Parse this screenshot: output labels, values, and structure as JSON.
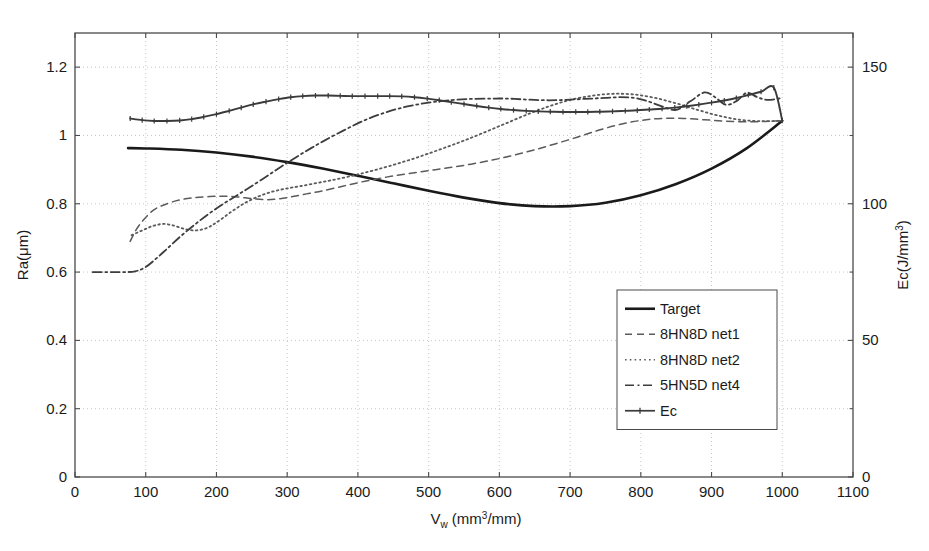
{
  "chart_data": {
    "type": "line",
    "title": "",
    "xlabel": "V_w (mm^3/mm)",
    "xlabel_parts": {
      "main": "V",
      "sub": "w",
      "unit_pre": " (mm",
      "unit_sup": "3",
      "unit_post": "/mm)"
    },
    "ylabel_left": "Ra(μm)",
    "ylabel_right": "Ec(J/mm^3)",
    "ylabel_right_parts": {
      "pre": "Ec(J/mm",
      "sup": "3",
      "post": ")"
    },
    "xlim": [
      0,
      1100
    ],
    "ylim_left": [
      0,
      1.3
    ],
    "ylim_right": [
      0,
      162.5
    ],
    "xticks": [
      0,
      100,
      200,
      300,
      400,
      500,
      600,
      700,
      800,
      900,
      1000,
      1100
    ],
    "xtick_labels": [
      "0",
      "100",
      "200",
      "300",
      "400",
      "500",
      "600",
      "700",
      "800",
      "900",
      "1000",
      "1100"
    ],
    "yticks_left": [
      0,
      0.2,
      0.4,
      0.6,
      0.8,
      1.0,
      1.2
    ],
    "ytick_labels_left": [
      "0",
      "0.2",
      "0.4",
      "0.6",
      "0.8",
      "1",
      "1.2"
    ],
    "yticks_right": [
      0,
      50,
      100,
      150
    ],
    "ytick_labels_right": [
      "0",
      "50",
      "100",
      "150"
    ],
    "grid": true,
    "grid_style": "dotted",
    "legend_position": "center-right",
    "series": [
      {
        "name": "Target",
        "style": "solid",
        "color": "#1a1a1a",
        "width": 2.6,
        "axis": "left",
        "x": [
          75,
          100,
          150,
          200,
          250,
          300,
          350,
          400,
          450,
          500,
          550,
          600,
          650,
          700,
          750,
          800,
          850,
          900,
          950,
          1000
        ],
        "y": [
          0.963,
          0.962,
          0.958,
          0.95,
          0.938,
          0.922,
          0.903,
          0.882,
          0.86,
          0.838,
          0.818,
          0.802,
          0.793,
          0.793,
          0.803,
          0.825,
          0.858,
          0.903,
          0.963,
          1.043
        ]
      },
      {
        "name": "8HN8D net1",
        "style": "dashed",
        "color": "#5b5b5b",
        "width": 1.5,
        "axis": "left",
        "x": [
          78,
          90,
          110,
          130,
          150,
          170,
          190,
          210,
          230,
          250,
          270,
          290,
          310,
          330,
          350,
          380,
          410,
          440,
          470,
          500,
          530,
          560,
          590,
          620,
          650,
          680,
          710,
          740,
          770,
          800,
          830,
          860,
          890,
          920,
          950,
          975,
          1000
        ],
        "y": [
          0.69,
          0.735,
          0.78,
          0.8,
          0.812,
          0.818,
          0.821,
          0.822,
          0.82,
          0.815,
          0.812,
          0.815,
          0.822,
          0.83,
          0.838,
          0.852,
          0.866,
          0.878,
          0.888,
          0.897,
          0.906,
          0.916,
          0.928,
          0.942,
          0.958,
          0.976,
          0.995,
          1.015,
          1.032,
          1.044,
          1.05,
          1.05,
          1.046,
          1.042,
          1.04,
          1.041,
          1.043
        ]
      },
      {
        "name": "8HN8D net2",
        "style": "dotted",
        "color": "#5b5b5b",
        "width": 1.8,
        "axis": "left",
        "x": [
          80,
          95,
          110,
          125,
          140,
          155,
          170,
          185,
          200,
          220,
          240,
          260,
          280,
          300,
          320,
          345,
          370,
          400,
          430,
          460,
          490,
          520,
          550,
          580,
          610,
          640,
          670,
          700,
          730,
          760,
          790,
          820,
          850,
          880,
          910,
          940,
          970,
          1000
        ],
        "y": [
          0.708,
          0.722,
          0.735,
          0.741,
          0.736,
          0.726,
          0.722,
          0.728,
          0.745,
          0.775,
          0.802,
          0.822,
          0.836,
          0.845,
          0.852,
          0.862,
          0.872,
          0.886,
          0.902,
          0.92,
          0.94,
          0.962,
          0.985,
          1.01,
          1.036,
          1.062,
          1.085,
          1.104,
          1.116,
          1.122,
          1.12,
          1.11,
          1.094,
          1.075,
          1.058,
          1.046,
          1.042,
          1.043
        ]
      },
      {
        "name": "5HN5D net4",
        "style": "dashdot",
        "color": "#3d3d3d",
        "width": 1.8,
        "axis": "left",
        "x": [
          25,
          45,
          65,
          85,
          100,
          115,
          130,
          150,
          170,
          190,
          210,
          230,
          250,
          275,
          300,
          325,
          350,
          380,
          410,
          440,
          470,
          500,
          530,
          560,
          590,
          610,
          630,
          650,
          670,
          690,
          710,
          730,
          750,
          770,
          790,
          810,
          830,
          850,
          870,
          890,
          905,
          920,
          935,
          950,
          965,
          980,
          1000
        ],
        "y": [
          0.6,
          0.6,
          0.6,
          0.602,
          0.615,
          0.64,
          0.668,
          0.706,
          0.74,
          0.772,
          0.8,
          0.826,
          0.852,
          0.886,
          0.92,
          0.952,
          0.982,
          1.015,
          1.045,
          1.068,
          1.085,
          1.096,
          1.103,
          1.107,
          1.108,
          1.108,
          1.106,
          1.104,
          1.103,
          1.104,
          1.106,
          1.108,
          1.11,
          1.112,
          1.11,
          1.1,
          1.085,
          1.075,
          1.1,
          1.126,
          1.112,
          1.09,
          1.1,
          1.125,
          1.112,
          1.104,
          1.11
        ]
      },
      {
        "name": "Ec",
        "style": "solid-marker",
        "color": "#3a3a3a",
        "width": 1.9,
        "marker": "tick",
        "axis": "right",
        "x": [
          78,
          95,
          112,
          130,
          148,
          165,
          182,
          200,
          218,
          235,
          252,
          270,
          288,
          305,
          322,
          340,
          358,
          375,
          392,
          410,
          428,
          445,
          462,
          480,
          498,
          515,
          532,
          550,
          568,
          585,
          602,
          620,
          638,
          655,
          672,
          690,
          708,
          725,
          742,
          760,
          778,
          795,
          812,
          830,
          848,
          865,
          882,
          900,
          918,
          935,
          952,
          970,
          988,
          1000
        ],
        "y": [
          131.2,
          130.6,
          130.3,
          130.3,
          130.5,
          131.0,
          131.8,
          132.8,
          134.0,
          135.2,
          136.4,
          137.4,
          138.3,
          139.0,
          139.4,
          139.6,
          139.6,
          139.5,
          139.4,
          139.4,
          139.4,
          139.4,
          139.3,
          139.0,
          138.5,
          137.9,
          137.2,
          136.5,
          135.8,
          135.2,
          134.7,
          134.3,
          134.0,
          133.8,
          133.7,
          133.6,
          133.6,
          133.6,
          133.7,
          133.8,
          134.0,
          134.2,
          134.5,
          134.8,
          135.2,
          135.7,
          136.3,
          137.0,
          137.8,
          138.7,
          139.8,
          141.0,
          142.5,
          130.4
        ]
      }
    ],
    "legend": [
      {
        "label": "Target",
        "style": "solid",
        "color": "#1a1a1a"
      },
      {
        "label": "8HN8D net1",
        "style": "dashed",
        "color": "#5b5b5b"
      },
      {
        "label": "8HN8D net2",
        "style": "dotted",
        "color": "#5b5b5b"
      },
      {
        "label": "5HN5D net4",
        "style": "dashdot",
        "color": "#3d3d3d"
      },
      {
        "label": "Ec",
        "style": "solid-marker",
        "color": "#3a3a3a"
      }
    ]
  },
  "figure": {
    "background": "#ffffff",
    "axis_color": "#4a4a4a",
    "grid_color": "#b8b8b8"
  }
}
